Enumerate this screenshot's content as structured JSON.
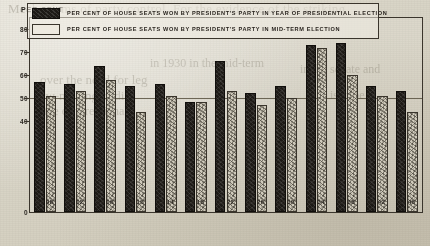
{
  "axis_caption": "PER CENT",
  "legend": [
    {
      "swatch": "dark",
      "label": "PER CENT OF HOUSE SEATS WON BY PRESIDENT'S PARTY IN YEAR OF PRESIDENTIAL ELECTION"
    },
    {
      "swatch": "light",
      "label": "PER CENT OF HOUSE SEATS WON BY PRESIDENT'S PARTY IN MID-TERM ELECTION"
    }
  ],
  "chart_data": {
    "type": "bar",
    "title": "",
    "xlabel": "",
    "ylabel": "PER CENT",
    "ylim": [
      0,
      85
    ],
    "yticks": [
      40,
      50,
      60,
      70,
      80
    ],
    "grid": false,
    "reference_line": 50,
    "legend_position": "top-inside",
    "categories": [
      "96 98",
      "00 02",
      "04 06",
      "08 10",
      "12 14",
      "16 18",
      "20 22",
      "24 26",
      "28 30",
      "32 34",
      "36 38",
      "40 42",
      "44 46"
    ],
    "series": [
      {
        "name": "PER CENT OF HOUSE SEATS WON BY PRESIDENT'S PARTY IN YEAR OF PRESIDENTIAL ELECTION",
        "values": [
          57,
          56,
          64,
          55,
          56,
          48,
          66,
          52,
          55,
          73,
          74,
          55,
          53
        ]
      },
      {
        "name": "PER CENT OF HOUSE SEATS WON BY PRESIDENT'S PARTY IN MID-TERM ELECTION",
        "values": [
          51,
          53,
          58,
          44,
          51,
          48,
          53,
          47,
          50,
          72,
          60,
          51,
          44
        ]
      }
    ]
  },
  "bleed_text": {
    "line1": "Mechanisms of party control.   For the evidence of the striking",
    "line2": "in 1930 in the mid-term",
    "line3": "over the need for leg",
    "line4": "law-making bodies",
    "line5": "the congressional",
    "line6": "in the senate and",
    "line7": "is to be"
  }
}
